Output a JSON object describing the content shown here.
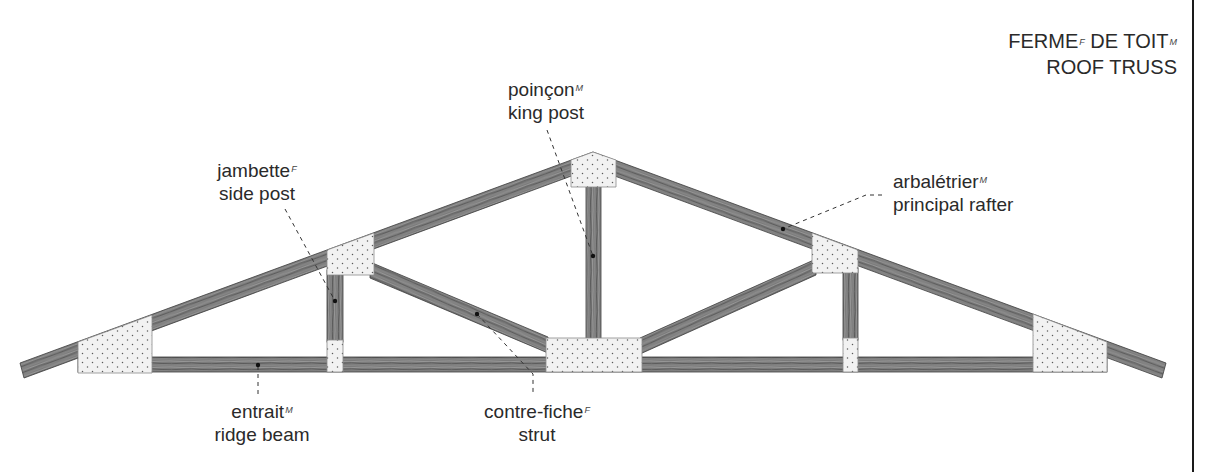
{
  "title": {
    "fr_1": "FERME",
    "fr_1_gender": "F",
    "fr_2": " DE TOIT",
    "fr_2_gender": "M",
    "en": "ROOF TRUSS"
  },
  "labels": {
    "king_post": {
      "fr": "poinçon",
      "gender": "M",
      "en": "king post"
    },
    "side_post": {
      "fr": "jambette",
      "gender": "F",
      "en": "side post"
    },
    "principal_rafter": {
      "fr": "arbalétrier",
      "gender": "M",
      "en": "principal rafter"
    },
    "ridge_beam": {
      "fr": "entrait",
      "gender": "M",
      "en": "ridge beam"
    },
    "strut": {
      "fr": "contre-fiche",
      "gender": "F",
      "en": "strut"
    }
  },
  "colors": {
    "wood": "#7b7b7b",
    "wood_grain_light": "#a4a4a4",
    "wood_grain_dark": "#4e4e4e",
    "gusset_plate": "#f2f2f2",
    "plate_dots": "#5a5a5a",
    "outline": "#3c3c3c",
    "leader": "#333333",
    "text": "#2a2a2a"
  }
}
